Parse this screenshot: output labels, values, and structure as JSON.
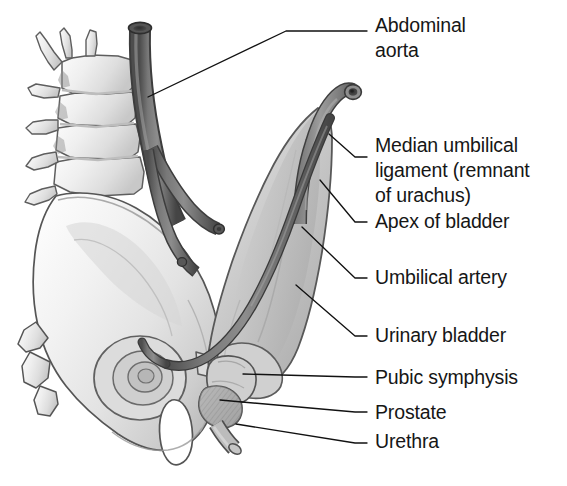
{
  "figure": {
    "background_color": "#ffffff",
    "text_color": "#161616",
    "leader_line_color": "#111111"
  },
  "labels": [
    {
      "id": "abdominal-aorta",
      "text": "Abdominal\naorta",
      "x": 375,
      "y": 13,
      "leader": {
        "points": "148,97 286,31 367,31",
        "anchor_x": 148,
        "anchor_y": 97
      }
    },
    {
      "id": "median-umbilical-ligament",
      "text": "Median umbilical\nligament (remnant\nof urachus)",
      "x": 375,
      "y": 133,
      "leader": {
        "points": "329,134 355,157 367,157",
        "anchor_x": 329,
        "anchor_y": 134
      }
    },
    {
      "id": "apex-of-bladder",
      "text": "Apex of bladder",
      "x": 375,
      "y": 209,
      "leader": {
        "points": "320,180 355,222 367,222",
        "anchor_x": 320,
        "anchor_y": 180
      }
    },
    {
      "id": "umbilical-artery",
      "text": "Umbilical artery",
      "x": 375,
      "y": 265,
      "leader": {
        "points": "302,227 355,278 367,278",
        "anchor_x": 302,
        "anchor_y": 227
      }
    },
    {
      "id": "urinary-bladder",
      "text": "Urinary bladder",
      "x": 375,
      "y": 323,
      "leader": {
        "points": "296,285 355,336 367,336",
        "anchor_x": 296,
        "anchor_y": 285
      }
    },
    {
      "id": "pubic-symphysis",
      "text": "Pubic symphysis",
      "x": 375,
      "y": 365,
      "leader": {
        "points": "243,374 355,377 367,377",
        "anchor_x": 243,
        "anchor_y": 374
      }
    },
    {
      "id": "prostate",
      "text": "Prostate",
      "x": 375,
      "y": 400,
      "leader": {
        "points": "220,400 355,412 367,412",
        "anchor_x": 220,
        "anchor_y": 400
      }
    },
    {
      "id": "urethra",
      "text": "Urethra",
      "x": 375,
      "y": 429,
      "leader": {
        "points": "236,424 355,443 367,443",
        "anchor_x": 236,
        "anchor_y": 424
      }
    }
  ],
  "structures": [
    {
      "id": "lumbar-vertebrae",
      "name": "Lumbar vertebrae",
      "fill": "#e9e9e9",
      "stroke": "#5e5e5e"
    },
    {
      "id": "sacrum",
      "name": "Sacrum",
      "fill": "#ebebeb",
      "stroke": "#5e5e5e"
    },
    {
      "id": "hip-bone-ilium",
      "name": "Hip bone (ilium)",
      "fill": "#eeeeee",
      "stroke": "#555555"
    },
    {
      "id": "abdominal-aorta-vessel",
      "name": "Abdominal aorta",
      "fill": "#6e6e6e",
      "stroke": "#3c3c3c"
    },
    {
      "id": "common-iliac-arteries",
      "name": "Common iliac arteries",
      "fill": "#6e6e6e",
      "stroke": "#3c3c3c"
    },
    {
      "id": "umbilical-artery-vessel",
      "name": "Umbilical artery",
      "fill": "#6a6a6a",
      "stroke": "#383838"
    },
    {
      "id": "urachus-ligament",
      "name": "Median umbilical ligament (urachus)",
      "fill": "#8a8a8a",
      "stroke": "#3f3f3f"
    },
    {
      "id": "urinary-bladder-organ",
      "name": "Urinary bladder",
      "fill": "#c9c9c9",
      "stroke": "#585858"
    },
    {
      "id": "pubic-symphysis-joint",
      "name": "Pubic symphysis",
      "fill": "#cfcfcf",
      "stroke": "#555555"
    },
    {
      "id": "prostate-gland",
      "name": "Prostate",
      "fill": "#b4b4b4",
      "stroke": "#4e4e4e"
    },
    {
      "id": "urethra-tube",
      "name": "Urethra",
      "fill": "#b8b8b8",
      "stroke": "#4e4e4e"
    },
    {
      "id": "obturator-foramen",
      "name": "Obturator foramen",
      "fill": "#ffffff",
      "stroke": "#555555"
    }
  ]
}
